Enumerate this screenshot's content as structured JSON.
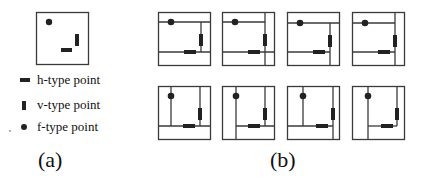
{
  "legend": {
    "h_label": "h-type point",
    "v_label": "v-type point",
    "f_label": "f-type point"
  },
  "captions": {
    "a": "(a)",
    "b": "(b)"
  },
  "colors": {
    "stroke": "#333333",
    "fill": "#222222"
  }
}
